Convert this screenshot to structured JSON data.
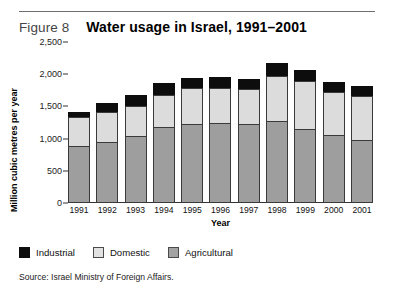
{
  "figure": {
    "number_label": "Figure 8",
    "title": "Water usage in Israel, 1991–2001",
    "source": "Source: Israel Ministry  of Foreign Affairs."
  },
  "legend": {
    "items": [
      {
        "label": "Industrial",
        "color": "#0d0d0d"
      },
      {
        "label": "Domestic",
        "color": "#e2e2e2"
      },
      {
        "label": "Agricultural",
        "color": "#a3a3a3"
      }
    ]
  },
  "chart_data": {
    "type": "bar",
    "stacked": true,
    "title": "Water usage in Israel, 1991–2001",
    "xlabel": "Year",
    "ylabel": "Million cubic metres per year",
    "categories": [
      "1991",
      "1992",
      "1993",
      "1994",
      "1995",
      "1996",
      "1997",
      "1998",
      "1999",
      "2000",
      "2001"
    ],
    "ytick_labels": [
      "2,500",
      "2,000",
      "1,500",
      "1,000",
      "500",
      "0"
    ],
    "ytick_values": [
      2500,
      2000,
      1500,
      1000,
      500,
      0
    ],
    "ylim": [
      0,
      2500
    ],
    "grid": false,
    "legend_position": "below-plot-left",
    "series": [
      {
        "name": "Agricultural",
        "color": "#a3a3a3",
        "values": [
          880,
          940,
          1040,
          1180,
          1220,
          1240,
          1230,
          1280,
          1150,
          1050,
          980
        ]
      },
      {
        "name": "Domestic",
        "color": "#e2e2e2",
        "values": [
          460,
          470,
          470,
          500,
          560,
          550,
          540,
          700,
          750,
          680,
          680
        ]
      },
      {
        "name": "Industrial",
        "color": "#0d0d0d",
        "values": [
          80,
          140,
          160,
          180,
          160,
          160,
          160,
          190,
          160,
          150,
          150
        ]
      }
    ],
    "totals": [
      1420,
      1550,
      1670,
      1860,
      1940,
      1950,
      1930,
      2170,
      2060,
      1880,
      1810
    ]
  }
}
